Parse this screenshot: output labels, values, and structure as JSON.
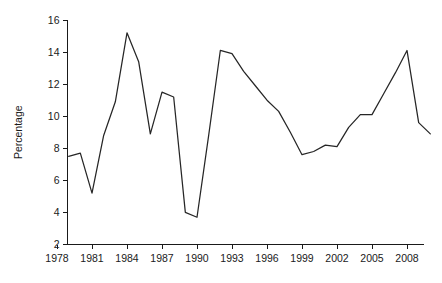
{
  "chart_data": {
    "type": "line",
    "title": "",
    "xlabel": "",
    "ylabel": "Percentage",
    "xlim": [
      1978,
      2010.5
    ],
    "ylim": [
      2,
      16
    ],
    "grid": false,
    "legend": "none",
    "xticks": [
      1978,
      1981,
      1984,
      1987,
      1990,
      1993,
      1996,
      1999,
      2002,
      2005,
      2008
    ],
    "xtick_labels": [
      "1978",
      "1981",
      "1984",
      "1987",
      "1990",
      "1993",
      "1996",
      "1999",
      "2002",
      "2005",
      "2008"
    ],
    "yticks": [
      2,
      4,
      6,
      8,
      10,
      12,
      14,
      16
    ],
    "ytick_labels": [
      "2",
      "4",
      "6",
      "8",
      "10",
      "12",
      "14",
      "16"
    ],
    "line_color": "#262626",
    "x": [
      1979,
      1980,
      1981,
      1982,
      1983,
      1984,
      1985,
      1986,
      1987,
      1988,
      1989,
      1990,
      1991,
      1992,
      1993,
      1994,
      1995,
      1996,
      1997,
      1998,
      1999,
      2000,
      2001,
      2002,
      2003,
      2004,
      2005,
      2006,
      2007,
      2008,
      2009,
      2010
    ],
    "values": [
      7.5,
      7.7,
      5.2,
      8.8,
      10.9,
      15.2,
      13.4,
      8.9,
      11.5,
      11.2,
      4.0,
      3.7,
      8.8,
      14.1,
      13.9,
      12.8,
      11.9,
      11.0,
      10.3,
      9.0,
      7.6,
      7.8,
      8.2,
      8.1,
      9.3,
      10.1,
      10.1,
      11.4,
      12.7,
      14.1,
      9.6,
      8.9
    ],
    "series": [
      {
        "name": "Percentage",
        "values": [
          7.5,
          7.7,
          5.2,
          8.8,
          10.9,
          15.2,
          13.4,
          8.9,
          11.5,
          11.2,
          4.0,
          3.7,
          8.8,
          14.1,
          13.9,
          12.8,
          11.9,
          11.0,
          10.3,
          9.0,
          7.6,
          7.8,
          8.2,
          8.1,
          9.3,
          10.1,
          10.1,
          11.4,
          12.7,
          14.1,
          9.6,
          8.9
        ]
      }
    ]
  }
}
